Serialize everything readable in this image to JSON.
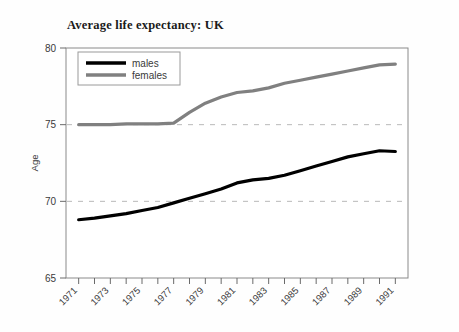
{
  "figure": {
    "title": "Average life expectancy: UK",
    "background_color": "#fefefe"
  },
  "axes": {
    "y_axis_label": "Age",
    "y_ticks": [
      "80",
      "75",
      "70",
      "65"
    ],
    "x_ticks_labeled": [
      "1971",
      "1973",
      "1975",
      "1977",
      "1979",
      "1981",
      "1983",
      "1985",
      "1987",
      "1989",
      "1991"
    ]
  },
  "legend": {
    "entries": [
      {
        "label": "males",
        "color": "#000000"
      },
      {
        "label": "females",
        "color": "#808080"
      }
    ]
  },
  "chart_data": {
    "type": "line",
    "title": "Average life expectancy: UK",
    "xlabel": "",
    "ylabel": "Age",
    "xlim": [
      1970.2,
      1991.8
    ],
    "ylim": [
      65,
      80
    ],
    "yticks": [
      65,
      70,
      75,
      80
    ],
    "xticks": [
      1971,
      1972,
      1973,
      1974,
      1975,
      1976,
      1977,
      1978,
      1979,
      1980,
      1981,
      1982,
      1983,
      1984,
      1985,
      1986,
      1987,
      1988,
      1989,
      1990,
      1991
    ],
    "xtick_labels_shown": [
      1971,
      1973,
      1975,
      1977,
      1979,
      1981,
      1983,
      1985,
      1987,
      1989,
      1991
    ],
    "xtick_label_rotation": 45,
    "grid": "horizontal dashed at 70 and 75",
    "legend_position": "upper left inside axes",
    "x": [
      1971,
      1972,
      1973,
      1974,
      1975,
      1976,
      1977,
      1978,
      1979,
      1980,
      1981,
      1982,
      1983,
      1984,
      1985,
      1986,
      1987,
      1988,
      1989,
      1990,
      1991
    ],
    "series": [
      {
        "name": "males",
        "color": "#000000",
        "values": [
          68.8,
          68.9,
          69.05,
          69.2,
          69.4,
          69.6,
          69.9,
          70.2,
          70.5,
          70.8,
          71.2,
          71.4,
          71.5,
          71.7,
          72.0,
          72.3,
          72.6,
          72.9,
          73.1,
          73.3,
          73.25
        ]
      },
      {
        "name": "females",
        "color": "#808080",
        "values": [
          75.0,
          75.0,
          75.0,
          75.05,
          75.05,
          75.05,
          75.1,
          75.8,
          76.4,
          76.8,
          77.1,
          77.2,
          77.4,
          77.7,
          77.9,
          78.1,
          78.3,
          78.5,
          78.7,
          78.9,
          78.95
        ]
      }
    ]
  }
}
